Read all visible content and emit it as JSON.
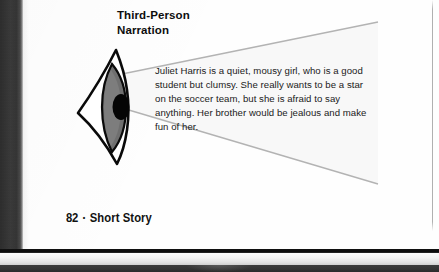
{
  "document": {
    "heading": {
      "line1": "Third-Person",
      "line2": "Narration"
    },
    "body_paragraph": "Juliet Harris is a quiet, mousy girl, who is a good student but clumsy. She really wants to be a star on the soccer team, but she is afraid to say anything. Her brother would be jealous and make fun of her.",
    "footer": {
      "page_number": "82",
      "separator": "•",
      "section_title": "Short Story"
    }
  },
  "illustration": {
    "eye": {
      "label": "eye-side-view",
      "outline_color": "#000000",
      "iris_color": "#6e6e6e",
      "iris_shade_color": "#8a8a8a",
      "pupil_color": "#000000",
      "sclera_color": "#ffffff"
    },
    "vision_cone": {
      "label": "vision-cone-rays",
      "line_color": "#b5b5b5",
      "fill_color": "#f7f7f7"
    }
  },
  "colors": {
    "page_background": "#fefefe",
    "gutter_band": "#323232",
    "text_primary": "#1a1a1a",
    "heading": "#0d0d0d",
    "margin_rule": "#969696"
  }
}
